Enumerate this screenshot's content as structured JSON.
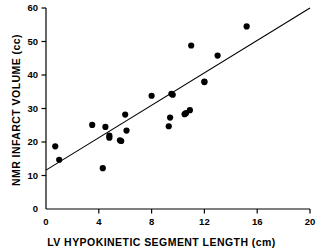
{
  "chart_data": {
    "type": "scatter",
    "title": "",
    "xlabel": "LV HYPOKINETIC SEGMENT LENGTH (cm)",
    "ylabel": "NMR INFARCT VOLUME (cc)",
    "xlim": [
      0,
      20
    ],
    "ylim": [
      0,
      60
    ],
    "xticks": [
      0,
      4,
      8,
      12,
      16,
      20
    ],
    "yticks": [
      0,
      10,
      20,
      30,
      40,
      50,
      60
    ],
    "xtick_labels": [
      "0",
      "4",
      "8",
      "12",
      "16",
      "20"
    ],
    "ytick_labels": [
      "0",
      "10",
      "20",
      "30",
      "40",
      "50",
      "60"
    ],
    "grid": false,
    "legend": null,
    "marker": "filled-circle",
    "marker_color": "#000000",
    "points": [
      {
        "x": 0.7,
        "y": 18.7
      },
      {
        "x": 1.0,
        "y": 14.7
      },
      {
        "x": 3.5,
        "y": 25.1
      },
      {
        "x": 4.3,
        "y": 12.2
      },
      {
        "x": 4.5,
        "y": 24.5
      },
      {
        "x": 4.8,
        "y": 21.9
      },
      {
        "x": 4.8,
        "y": 21.3
      },
      {
        "x": 5.6,
        "y": 20.5
      },
      {
        "x": 5.7,
        "y": 20.3
      },
      {
        "x": 6.0,
        "y": 28.2
      },
      {
        "x": 6.1,
        "y": 23.4
      },
      {
        "x": 8.0,
        "y": 33.8
      },
      {
        "x": 9.3,
        "y": 24.7
      },
      {
        "x": 9.4,
        "y": 27.3
      },
      {
        "x": 9.5,
        "y": 34.4
      },
      {
        "x": 9.6,
        "y": 34.1
      },
      {
        "x": 10.5,
        "y": 28.3
      },
      {
        "x": 10.6,
        "y": 28.6
      },
      {
        "x": 10.9,
        "y": 29.5
      },
      {
        "x": 11.0,
        "y": 48.8
      },
      {
        "x": 12.0,
        "y": 38.0
      },
      {
        "x": 12.0,
        "y": 37.9
      },
      {
        "x": 13.0,
        "y": 45.8
      },
      {
        "x": 15.2,
        "y": 54.5
      }
    ],
    "regression_line": {
      "x_start": 0.0,
      "y_start": 11.6,
      "x_end": 20.0,
      "y_end": 60.0,
      "color": "#000000"
    }
  }
}
